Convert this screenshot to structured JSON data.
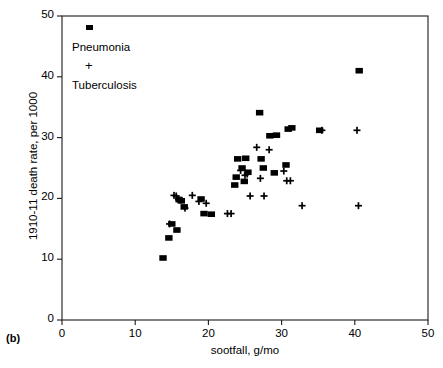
{
  "figure": {
    "panel_label": "(b)",
    "background_color": "#ffffff",
    "marker_color": "#000000",
    "axis_color": "#1a1a1a"
  },
  "chart_data": {
    "type": "scatter",
    "title": "",
    "xlabel": "sootfall, g/mo",
    "ylabel": "1910-11 death rate, per 1000",
    "xlim": [
      0,
      50
    ],
    "ylim": [
      0,
      50
    ],
    "xticks": [
      0,
      10,
      20,
      30,
      40,
      50
    ],
    "yticks": [
      0,
      10,
      20,
      30,
      40,
      50
    ],
    "xtick_labels": [
      "0",
      "10",
      "20",
      "30",
      "40",
      "50"
    ],
    "ytick_labels": [
      "0",
      "10",
      "20",
      "30",
      "40",
      "50"
    ],
    "grid": false,
    "legend_position": "upper-left",
    "series": [
      {
        "name": "Pneumonia",
        "marker": "square",
        "color": "#000000",
        "points": [
          [
            13.8,
            10.2
          ],
          [
            14.6,
            13.5
          ],
          [
            15.0,
            15.8
          ],
          [
            15.7,
            14.8
          ],
          [
            16.0,
            19.8
          ],
          [
            16.3,
            19.6
          ],
          [
            16.7,
            18.6
          ],
          [
            19.0,
            19.9
          ],
          [
            19.4,
            17.5
          ],
          [
            20.4,
            17.4
          ],
          [
            23.6,
            22.2
          ],
          [
            23.8,
            23.5
          ],
          [
            24.0,
            26.5
          ],
          [
            24.6,
            25.0
          ],
          [
            24.9,
            22.8
          ],
          [
            25.1,
            26.6
          ],
          [
            25.4,
            24.3
          ],
          [
            27.0,
            34.1
          ],
          [
            27.2,
            26.5
          ],
          [
            27.5,
            25.0
          ],
          [
            28.4,
            30.3
          ],
          [
            29.0,
            24.2
          ],
          [
            29.3,
            30.4
          ],
          [
            30.6,
            25.5
          ],
          [
            30.9,
            31.4
          ],
          [
            31.4,
            31.6
          ],
          [
            35.2,
            31.2
          ],
          [
            40.6,
            41.0
          ]
        ]
      },
      {
        "name": "Tuberculosis",
        "marker": "plus",
        "color": "#000000",
        "points": [
          [
            14.7,
            15.8
          ],
          [
            15.3,
            20.5
          ],
          [
            15.6,
            20.4
          ],
          [
            15.9,
            19.8
          ],
          [
            16.2,
            19.7
          ],
          [
            16.8,
            18.4
          ],
          [
            17.8,
            20.5
          ],
          [
            18.7,
            19.5
          ],
          [
            19.7,
            19.2
          ],
          [
            22.6,
            17.5
          ],
          [
            23.1,
            17.5
          ],
          [
            24.4,
            24.6
          ],
          [
            25.0,
            23.8
          ],
          [
            25.3,
            24.0
          ],
          [
            25.7,
            20.4
          ],
          [
            26.6,
            28.4
          ],
          [
            27.1,
            23.3
          ],
          [
            27.6,
            20.4
          ],
          [
            28.3,
            28.0
          ],
          [
            30.3,
            24.5
          ],
          [
            30.7,
            22.9
          ],
          [
            31.2,
            22.9
          ],
          [
            32.8,
            18.8
          ],
          [
            35.5,
            31.2
          ],
          [
            40.3,
            31.2
          ],
          [
            40.5,
            18.8
          ]
        ]
      }
    ]
  },
  "legend": {
    "entries": [
      {
        "label": "Pneumonia",
        "marker": "square-marker"
      },
      {
        "label": "Tuberculosis",
        "marker": "plus-marker"
      }
    ]
  }
}
